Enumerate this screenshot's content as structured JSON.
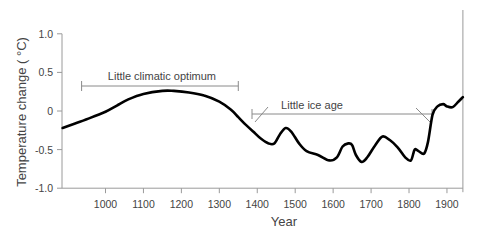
{
  "chart_data": {
    "type": "line",
    "title": "",
    "xlabel": "Year",
    "ylabel": "Temperature change ( °C)",
    "xlim": [
      887,
      1942
    ],
    "ylim": [
      -1.0,
      1.0
    ],
    "grid": false,
    "legend": null,
    "x_ticks": [
      1000,
      1100,
      1200,
      1300,
      1400,
      1500,
      1600,
      1700,
      1800,
      1900
    ],
    "x_tick_labels": [
      "1000",
      "1100",
      "1200",
      "1300",
      "1400",
      "1500",
      "1600",
      "1700",
      "1800",
      "1900"
    ],
    "y_ticks": [
      1.0,
      0.5,
      0,
      -0.5,
      -1.0
    ],
    "y_tick_labels": [
      "1.0",
      "0.5",
      "0",
      "-0.5",
      "-1.0"
    ],
    "series": [
      {
        "name": "Temperature change",
        "color": "#000000",
        "x": [
          887,
          920,
          960,
          1000,
          1030,
          1060,
          1100,
          1150,
          1180,
          1220,
          1260,
          1300,
          1330,
          1350,
          1370,
          1390,
          1410,
          1430,
          1445,
          1460,
          1475,
          1490,
          1510,
          1530,
          1560,
          1590,
          1610,
          1625,
          1640,
          1650,
          1660,
          1675,
          1690,
          1710,
          1730,
          1750,
          1770,
          1790,
          1805,
          1815,
          1825,
          1840,
          1850,
          1862,
          1875,
          1890,
          1900,
          1915,
          1930,
          1942
        ],
        "y": [
          -0.22,
          -0.16,
          -0.09,
          -0.01,
          0.07,
          0.15,
          0.22,
          0.26,
          0.26,
          0.24,
          0.2,
          0.12,
          0.02,
          -0.08,
          -0.18,
          -0.27,
          -0.36,
          -0.42,
          -0.42,
          -0.3,
          -0.22,
          -0.27,
          -0.42,
          -0.52,
          -0.57,
          -0.64,
          -0.6,
          -0.46,
          -0.42,
          -0.44,
          -0.57,
          -0.66,
          -0.6,
          -0.45,
          -0.33,
          -0.38,
          -0.47,
          -0.6,
          -0.64,
          -0.5,
          -0.52,
          -0.55,
          -0.4,
          -0.05,
          0.06,
          0.09,
          0.06,
          0.05,
          0.12,
          0.18
        ]
      }
    ],
    "annotations": [
      {
        "text": "Little climatic optimum",
        "x_start": 937,
        "x_end": 1350,
        "y": 0.32
      },
      {
        "text": "Little ice age",
        "x_start": 1390,
        "x_end": 1862,
        "y": -0.04
      }
    ]
  }
}
